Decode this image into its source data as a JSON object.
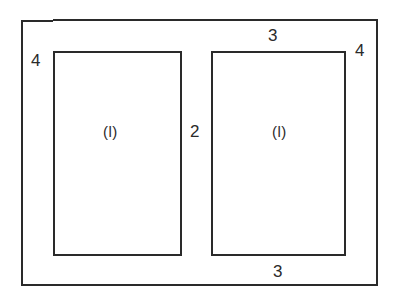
{
  "diagram": {
    "type": "cabinet door frame / face frame assembly",
    "parts": {
      "post_left": {
        "label": "4"
      },
      "post_right": {
        "label": "4"
      },
      "rail_top": {
        "label": "3"
      },
      "rail_bottom": {
        "label": "3"
      },
      "stile_center": {
        "label": "2"
      },
      "panel_left": {
        "label": "(l)"
      },
      "panel_right": {
        "label": "(l)"
      }
    },
    "colors": {
      "line": "#2a2a2a",
      "background": "#ffffff"
    }
  }
}
